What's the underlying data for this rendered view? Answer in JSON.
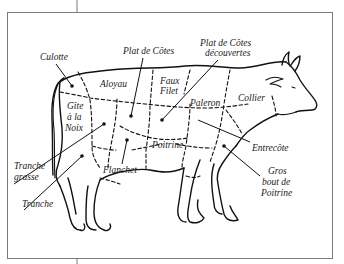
{
  "diagram": {
    "title": "",
    "labels": {
      "culotte": "Culotte",
      "plat_de_cotes": "Plat de Côtes",
      "plat_de_cotes_decouvertes_1": "Plat de Côtes",
      "plat_de_cotes_decouvertes_2": "découvertes",
      "aloyau": "Aloyau",
      "faux_filet_1": "Faux",
      "faux_filet_2": "Filet",
      "gite_1": "Gîte",
      "gite_2": "à la",
      "gite_3": "Noix",
      "paleron": "Paleron",
      "collier": "Collier",
      "entrecote": "Entrecôte",
      "poitrine": "Poitrine",
      "gros_bout_1": "Gros",
      "gros_bout_2": "bout de",
      "gros_bout_3": "Poitrine",
      "tranche_grasse_1": "Tranche",
      "tranche_grasse_2": "grasse",
      "flanchet": "Flanchet",
      "tranche": "Tranche"
    },
    "colors": {
      "line": "#111111",
      "frame": "#7a7a7a",
      "background": "#ffffff"
    }
  }
}
